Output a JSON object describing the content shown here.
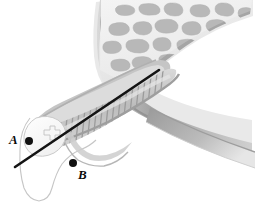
{
  "figure": {
    "background_color": "#ffffff",
    "width": 255,
    "height": 208
  },
  "labels": [
    {
      "id": "A",
      "text": "A",
      "x": 9,
      "y": 133,
      "marker_x": 29,
      "marker_y": 141
    },
    {
      "id": "B",
      "text": "B",
      "x": 78,
      "y": 168,
      "marker_x": 73,
      "marker_y": 163
    }
  ],
  "markers": {
    "radius": 4,
    "color": "#111111"
  },
  "instrument_line": {
    "name": "needle-path",
    "x1": 15,
    "y1": 167,
    "x2": 159,
    "y2": 70,
    "color": "#141414",
    "width": 2.6
  },
  "palette": {
    "background": "#ffffff",
    "cortical_dark": "#8f8f8f",
    "cortical_mid": "#aeaeae",
    "cortical_light": "#d6d6d6",
    "marrow_light": "#ececec",
    "trabecula_gray": "#a6a6a6",
    "trabecula_dark": "#8c8c8c",
    "canal_stripe": "#9a9a9a",
    "canal_fill": "#c9c9c9",
    "tip_white": "#fbfbfb",
    "outline_light": "#c4c4c4",
    "ink": "#111111"
  },
  "regions": [
    {
      "name": "trabecular-bone-region",
      "description": "irregular gray trabeculae in light marrow, upper right"
    },
    {
      "name": "cortical-shell-region",
      "description": "curved dense gray cortical band along left and lower margins"
    },
    {
      "name": "striped-canal-region",
      "description": "tubular striated canal running lower-left to upper-right"
    },
    {
      "name": "rounded-tip-region",
      "description": "pale rounded apical tip at left with small notch"
    },
    {
      "name": "soft-tissue-lobe-region",
      "description": "thin outlined lobe hanging below the tip"
    },
    {
      "name": "tapering-tail-region",
      "description": "curved gray band tapering toward lower right"
    }
  ]
}
